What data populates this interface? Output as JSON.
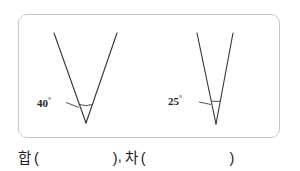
{
  "figure": {
    "panel_name": "angle-figure-panel",
    "border_color": "#c9c9c9",
    "stroke_color": "#3a3a3a",
    "background": "#ffffff",
    "angles": [
      {
        "id": "left",
        "label_value": "40",
        "degree_symbol": "°",
        "label_full": "40°",
        "vertex_x": 67,
        "vertex_y": 108,
        "left_ray_x": 35,
        "left_ray_y": 18,
        "right_ray_x": 98,
        "right_ray_y": 18,
        "label_x": 28,
        "label_y": 92
      },
      {
        "id": "right",
        "label_value": "25",
        "degree_symbol": "°",
        "label_full": "25°",
        "vertex_x": 197,
        "vertex_y": 109,
        "left_ray_x": 178,
        "left_ray_y": 18,
        "right_ray_x": 214,
        "right_ray_y": 18,
        "label_x": 156,
        "label_y": 92
      }
    ]
  },
  "answer_line": {
    "sum_word": "합",
    "sum_paren_open": "(",
    "sum_blank": "",
    "sum_paren_close": ")",
    "separator": ",",
    "diff_word": "차",
    "diff_paren_open": "(",
    "diff_blank": "",
    "diff_paren_close": ")"
  }
}
